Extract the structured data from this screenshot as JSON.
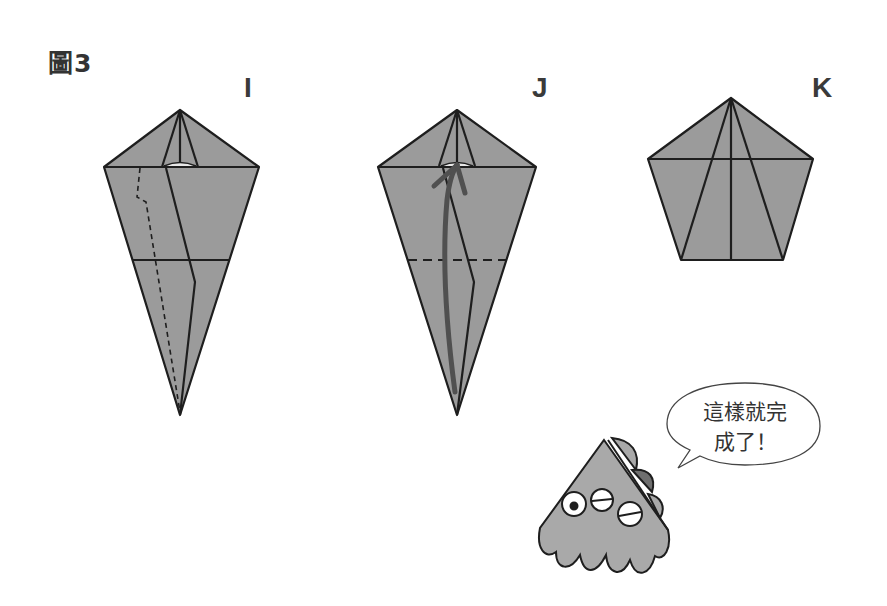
{
  "figure": {
    "title": "圖3",
    "steps": [
      {
        "id": "I",
        "label": "I",
        "description": "Kite shape with dashed fold line along left, horizontal crease"
      },
      {
        "id": "J",
        "label": "J",
        "description": "Kite shape with dashed horizontal fold line and upward fold arrow"
      },
      {
        "id": "K",
        "label": "K",
        "description": "Completed pentagon shape"
      }
    ]
  },
  "mascot": {
    "speech": {
      "line1": "這樣就完",
      "line2": "成了！"
    }
  },
  "colors": {
    "paper": "#9b9b9b",
    "line": "#1e1e1e",
    "arrow": "#505050",
    "mascot_body": "#a9a9a9",
    "mascot_dark": "#6f6f6f"
  }
}
